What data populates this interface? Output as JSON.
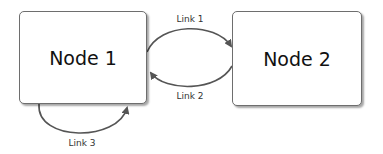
{
  "diagram": {
    "nodes": [
      {
        "id": "node1",
        "label": "Node 1"
      },
      {
        "id": "node2",
        "label": "Node 2"
      }
    ],
    "links": [
      {
        "id": "link1",
        "label": "Link 1",
        "from": "Node 1",
        "to": "Node 2"
      },
      {
        "id": "link2",
        "label": "Link 2",
        "from": "Node 2",
        "to": "Node 1"
      },
      {
        "id": "link3",
        "label": "Link 3",
        "from": "Node 1",
        "to": "Node 1"
      }
    ],
    "colors": {
      "edge": "#555555",
      "border": "#6e6e6e",
      "text": "#111111"
    }
  }
}
